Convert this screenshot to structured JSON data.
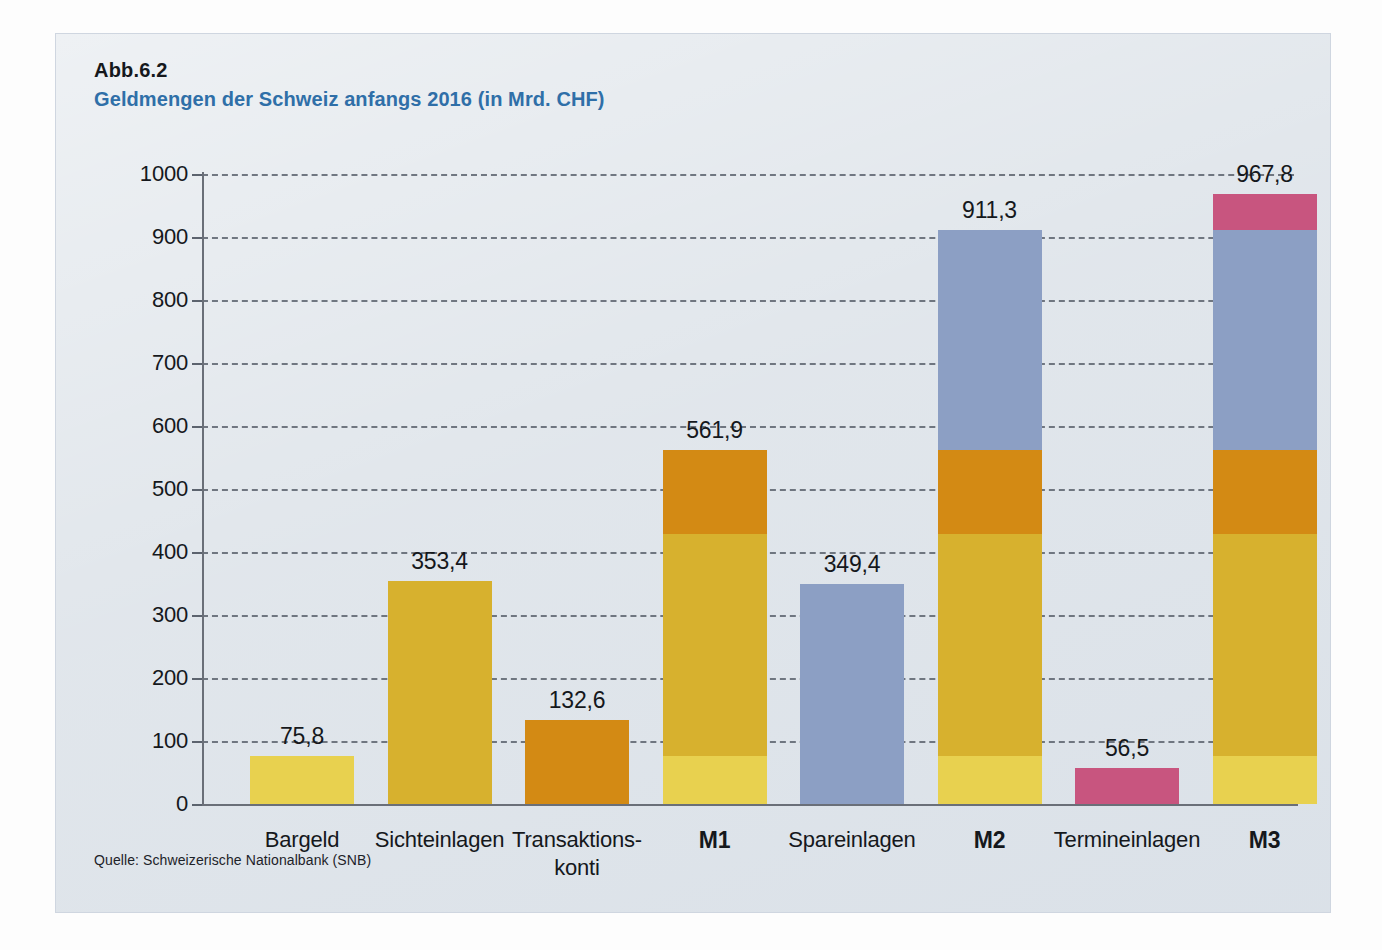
{
  "figure": {
    "number": "Abb.6.2",
    "title": "Geldmengen der Schweiz anfangs 2016 (in Mrd. CHF)",
    "source": "Quelle: Schweizerische Nationalbank (SNB)"
  },
  "colors": {
    "background": "#dde3e9",
    "title_blue": "#2f6fa8",
    "bargeld": "#E8D14F",
    "sichteinlagen": "#D7B12E",
    "transaktionskonti": "#D38A14",
    "spareinlagen": "#8C9FC4",
    "termineinlagen": "#C8557F",
    "axis": "#5c636e",
    "text": "#15181c"
  },
  "chart_data": {
    "type": "bar",
    "title": "Geldmengen der Schweiz anfangs 2016 (in Mrd. CHF)",
    "xlabel": "",
    "ylabel": "",
    "ylim": [
      0,
      1000
    ],
    "ytick_step": 100,
    "yticks": [
      "1000",
      "900",
      "800",
      "700",
      "600",
      "500",
      "400",
      "300",
      "200",
      "100",
      "0"
    ],
    "grid": true,
    "legend": "none",
    "stacked": true,
    "components": [
      {
        "key": "bargeld",
        "name": "Bargeld",
        "color": "#E8D14F",
        "value": 75.8
      },
      {
        "key": "sichteinlagen",
        "name": "Sichteinlagen",
        "color": "#D7B12E",
        "value": 353.4
      },
      {
        "key": "transaktionskonti",
        "name": "Transaktionskonti",
        "color": "#D38A14",
        "value": 132.6
      },
      {
        "key": "spareinlagen",
        "name": "Spareinlagen",
        "color": "#8C9FC4",
        "value": 349.4
      },
      {
        "key": "termineinlagen",
        "name": "Termineinlagen",
        "color": "#C8557F",
        "value": 56.5
      }
    ],
    "categories": [
      "Bargeld",
      "Sichteinlagen",
      "Transaktions-konti",
      "M1",
      "Spareinlagen",
      "M2",
      "Termineinlagen",
      "M3"
    ],
    "values": [
      75.8,
      353.4,
      132.6,
      561.9,
      349.4,
      911.3,
      56.5,
      967.8
    ],
    "bars": [
      {
        "label_lines": [
          "Bargeld"
        ],
        "bold": false,
        "total": 75.8,
        "total_text": "75,8",
        "segments": [
          {
            "key": "bargeld",
            "value": 75.8,
            "color": "#E8D14F"
          }
        ]
      },
      {
        "label_lines": [
          "Sichteinlagen"
        ],
        "bold": false,
        "total": 353.4,
        "total_text": "353,4",
        "segments": [
          {
            "key": "sichteinlagen",
            "value": 353.4,
            "color": "#D7B12E"
          }
        ]
      },
      {
        "label_lines": [
          "Transaktions-",
          "konti"
        ],
        "bold": false,
        "total": 132.6,
        "total_text": "132,6",
        "segments": [
          {
            "key": "transaktionskonti",
            "value": 132.6,
            "color": "#D38A14"
          }
        ]
      },
      {
        "label_lines": [
          "M1"
        ],
        "bold": true,
        "total": 561.9,
        "total_text": "561,9",
        "segments": [
          {
            "key": "bargeld",
            "value": 75.8,
            "color": "#E8D14F"
          },
          {
            "key": "sichteinlagen",
            "value": 353.4,
            "color": "#D7B12E"
          },
          {
            "key": "transaktionskonti",
            "value": 132.6,
            "color": "#D38A14"
          }
        ]
      },
      {
        "label_lines": [
          "Spareinlagen"
        ],
        "bold": false,
        "total": 349.4,
        "total_text": "349,4",
        "segments": [
          {
            "key": "spareinlagen",
            "value": 349.4,
            "color": "#8C9FC4"
          }
        ]
      },
      {
        "label_lines": [
          "M2"
        ],
        "bold": true,
        "total": 911.3,
        "total_text": "911,3",
        "segments": [
          {
            "key": "bargeld",
            "value": 75.8,
            "color": "#E8D14F"
          },
          {
            "key": "sichteinlagen",
            "value": 353.4,
            "color": "#D7B12E"
          },
          {
            "key": "transaktionskonti",
            "value": 132.6,
            "color": "#D38A14"
          },
          {
            "key": "spareinlagen",
            "value": 349.4,
            "color": "#8C9FC4"
          }
        ]
      },
      {
        "label_lines": [
          "Termineinlagen"
        ],
        "bold": false,
        "total": 56.5,
        "total_text": "56,5",
        "segments": [
          {
            "key": "termineinlagen",
            "value": 56.5,
            "color": "#C8557F"
          }
        ]
      },
      {
        "label_lines": [
          "M3"
        ],
        "bold": true,
        "total": 967.8,
        "total_text": "967,8",
        "segments": [
          {
            "key": "bargeld",
            "value": 75.8,
            "color": "#E8D14F"
          },
          {
            "key": "sichteinlagen",
            "value": 353.4,
            "color": "#D7B12E"
          },
          {
            "key": "transaktionskonti",
            "value": 132.6,
            "color": "#D38A14"
          },
          {
            "key": "spareinlagen",
            "value": 349.4,
            "color": "#8C9FC4"
          },
          {
            "key": "termineinlagen",
            "value": 56.5,
            "color": "#C8557F"
          }
        ]
      }
    ]
  }
}
